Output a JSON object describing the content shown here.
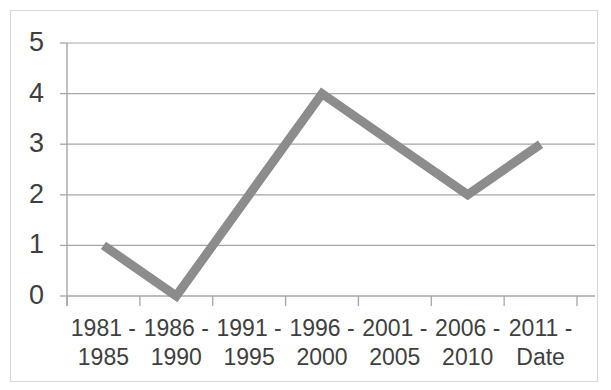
{
  "chart_data": {
    "type": "line",
    "title": "",
    "subtitle": "",
    "xlabel": "Date",
    "ylabel": "",
    "categories": [
      "1981 - 1985",
      "1986 - 1990",
      "1991 - 1995",
      "1996 - 2000",
      "2001 - 2005",
      "2006 - 2010",
      "2011 - Date"
    ],
    "category_lines": [
      [
        "1981 -",
        "1985"
      ],
      [
        "1986 -",
        "1990"
      ],
      [
        "1991 -",
        "1995"
      ],
      [
        "1996 -",
        "2000"
      ],
      [
        "2001 -",
        "2005"
      ],
      [
        "2006 -",
        "2010"
      ],
      [
        "2011 -",
        "Date"
      ]
    ],
    "values": [
      1,
      0,
      2,
      4,
      3,
      2,
      3
    ],
    "series": [
      {
        "name": "Count",
        "values": [
          1,
          0,
          2,
          4,
          3,
          2,
          3
        ]
      }
    ],
    "ylim": [
      0,
      5
    ],
    "yticks": [
      0,
      1,
      2,
      3,
      4,
      5
    ],
    "ytick_labels": [
      "0",
      "1",
      "2",
      "3",
      "4",
      "5"
    ],
    "grid": true,
    "grid_axis": "y",
    "legend": false,
    "legend_position": "none",
    "markers": false,
    "line_color": "#8c8c8c",
    "line_width": 9,
    "grid_color": "#a6a6a6",
    "axis_color": "#a6a6a6",
    "frame_color": "#d9d9d9",
    "text_color": "#3f3f3f",
    "background": "#ffffff",
    "annotations": []
  },
  "axes": {
    "y_tick_labels": [
      "5",
      "4",
      "3",
      "2",
      "1",
      "0"
    ],
    "x_tick_labels": [
      "1981 -\n1985",
      "1986 -\n1990",
      "1991 -\n1995",
      "1996 -\n2000",
      "2001 -\n2005",
      "2006 -\n2010",
      "2011 -\nDate"
    ]
  }
}
